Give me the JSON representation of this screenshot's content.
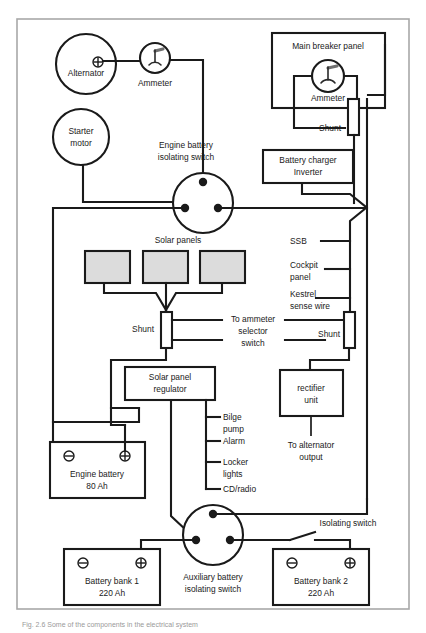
{
  "figure": {
    "type": "boat-electrical-wiring-diagram",
    "caption": "Fig. 2.6  Some of the components in the electrical system",
    "frame_color": "#a8a8a8",
    "line_color": "#1a1a1a",
    "panel_fill": "#dcdcdc",
    "background": "#ffffff"
  },
  "components": {
    "alternator": {
      "label": "Alternator",
      "terminal_symbol": "+"
    },
    "starter_motor": {
      "label_line1": "Starter",
      "label_line2": "motor"
    },
    "engine_ammeter": {
      "label": "Ammeter"
    },
    "engine_isolating_switch": {
      "label_line1": "Engine battery",
      "label_line2": "isolating switch"
    },
    "main_breaker_panel": {
      "label": "Main breaker panel"
    },
    "panel_ammeter": {
      "label": "Ammeter"
    },
    "panel_shunt": {
      "label": "Shunt"
    },
    "battery_charger": {
      "label_line1": "Battery charger",
      "label_line2": "Inverter"
    },
    "solar_panels": {
      "label": "Solar panels",
      "count": 3
    },
    "solar_shunt": {
      "label": "Shunt"
    },
    "right_shunt": {
      "label": "Shunt"
    },
    "ammeter_selector": {
      "label_line1": "To ammeter",
      "label_line2": "selector",
      "label_line3": "switch"
    },
    "solar_regulator": {
      "label_line1": "Solar panel",
      "label_line2": "regulator"
    },
    "rectifier": {
      "label_line1": "rectifier",
      "label_line2": "unit"
    },
    "to_alternator_output": {
      "label_line1": "To alternator",
      "label_line2": "output"
    },
    "engine_battery": {
      "label": "Engine battery",
      "capacity": "80 Ah",
      "neg": "−",
      "pos": "+"
    },
    "battery_bank_1": {
      "label": "Battery bank 1",
      "capacity": "220 Ah",
      "neg": "−",
      "pos": "+"
    },
    "battery_bank_2": {
      "label": "Battery bank 2",
      "capacity": "220 Ah",
      "neg": "−",
      "pos": "+"
    },
    "auxiliary_isolating_switch": {
      "label_line1": "Auxiliary battery",
      "label_line2": "isolating switch"
    },
    "isolating_switch": {
      "label": "Isolating switch"
    }
  },
  "right_feeds": [
    {
      "label": "SSB"
    },
    {
      "label_line1": "Cockpit",
      "label_line2": "panel"
    },
    {
      "label_line1": "Kestrel",
      "label_line2": "sense wire"
    }
  ],
  "regulator_loads": [
    {
      "line1": "Bilge",
      "line2": "pump"
    },
    {
      "line1": "Alarm",
      "line2": ""
    },
    {
      "line1": "Locker",
      "line2": "lights"
    },
    {
      "line1": "CD/radio",
      "line2": ""
    }
  ]
}
